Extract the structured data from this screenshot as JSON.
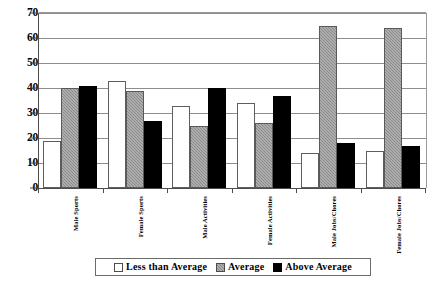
{
  "chart_data": {
    "type": "bar",
    "title": "",
    "subtitle": "",
    "xlabel": "",
    "ylabel": "",
    "ylim": [
      0,
      70
    ],
    "yticks": [
      0,
      10,
      20,
      30,
      40,
      50,
      60,
      70
    ],
    "grid": true,
    "legend_position": "bottom",
    "categories": [
      "Male Sports",
      "Female Sports",
      "Male Activities",
      "Female Activities",
      "Male Jobs/Chores",
      "Female Jobs/Chores"
    ],
    "series": [
      {
        "name": "Less than Average",
        "color": "#ffffff",
        "values": [
          19,
          43,
          33,
          34,
          14,
          15
        ]
      },
      {
        "name": "Average",
        "color": "#8a8a8a",
        "values": [
          40,
          39,
          25,
          26,
          65,
          64
        ]
      },
      {
        "name": "Above Average",
        "color": "#000000",
        "values": [
          41,
          27,
          40,
          37,
          18,
          17
        ]
      }
    ]
  },
  "legend": {
    "entries": [
      {
        "label": "Less than Average"
      },
      {
        "label": "Average"
      },
      {
        "label": "Above Average"
      }
    ]
  }
}
